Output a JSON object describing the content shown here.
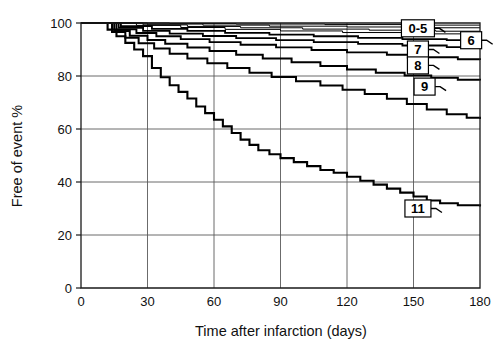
{
  "chart_data": {
    "type": "line",
    "subtype": "kaplan-meier-step",
    "title": "",
    "xlabel": "Time after infarction (days)",
    "ylabel": "Free of event %",
    "xlim": [
      0,
      180
    ],
    "ylim": [
      0,
      100
    ],
    "xticks": [
      0,
      30,
      60,
      90,
      120,
      150,
      180
    ],
    "yticks": [
      0,
      20,
      40,
      60,
      80,
      100
    ],
    "xtick_labels": [
      "0",
      "30",
      "60",
      "90",
      "120",
      "150",
      "180"
    ],
    "ytick_labels": [
      "0",
      "20",
      "40",
      "60",
      "80",
      "100"
    ],
    "grid": "both",
    "legend_position": "inline-callouts",
    "series": [
      {
        "name": "0-5",
        "label": "0-5",
        "stroke_width": 1.0,
        "final_value": 99.2,
        "points": [
          [
            0,
            100
          ],
          [
            8,
            100
          ],
          [
            40,
            99.8
          ],
          [
            70,
            99.6
          ],
          [
            110,
            99.4
          ],
          [
            150,
            99.2
          ],
          [
            180,
            99.2
          ]
        ]
      },
      {
        "name": "0-5b",
        "label": "",
        "stroke_width": 1.0,
        "final_value": 98.2,
        "points": [
          [
            0,
            100
          ],
          [
            8,
            100
          ],
          [
            30,
            99.6
          ],
          [
            55,
            99.2
          ],
          [
            85,
            98.8
          ],
          [
            120,
            98.5
          ],
          [
            155,
            98.2
          ],
          [
            180,
            98.2
          ]
        ]
      },
      {
        "name": "0-5c",
        "label": "",
        "stroke_width": 1.0,
        "final_value": 96.9,
        "points": [
          [
            0,
            100
          ],
          [
            8,
            100
          ],
          [
            28,
            99.3
          ],
          [
            48,
            98.7
          ],
          [
            72,
            98.2
          ],
          [
            100,
            97.7
          ],
          [
            130,
            97.3
          ],
          [
            160,
            96.9
          ],
          [
            180,
            96.9
          ]
        ]
      },
      {
        "name": "0-5d",
        "label": "",
        "stroke_width": 1.0,
        "final_value": 95.6,
        "points": [
          [
            0,
            100
          ],
          [
            8,
            100
          ],
          [
            25,
            99.1
          ],
          [
            45,
            98.3
          ],
          [
            65,
            97.6
          ],
          [
            90,
            97.0
          ],
          [
            118,
            96.4
          ],
          [
            148,
            95.9
          ],
          [
            175,
            95.6
          ],
          [
            180,
            95.6
          ]
        ]
      },
      {
        "name": "6",
        "label": "6",
        "stroke_width": 1.8,
        "final_value": 93.4,
        "points": [
          [
            0,
            100
          ],
          [
            8,
            100
          ],
          [
            18,
            98.8
          ],
          [
            32,
            97.8
          ],
          [
            48,
            97.0
          ],
          [
            65,
            96.3
          ],
          [
            85,
            95.6
          ],
          [
            105,
            95.0
          ],
          [
            125,
            94.4
          ],
          [
            145,
            93.9
          ],
          [
            165,
            93.5
          ],
          [
            180,
            93.4
          ]
        ]
      },
      {
        "name": "7",
        "label": "7",
        "stroke_width": 1.8,
        "final_value": 90.6,
        "points": [
          [
            0,
            100
          ],
          [
            8,
            100
          ],
          [
            17,
            98.2
          ],
          [
            28,
            97.0
          ],
          [
            40,
            96.0
          ],
          [
            55,
            95.1
          ],
          [
            70,
            94.3
          ],
          [
            88,
            93.5
          ],
          [
            105,
            92.8
          ],
          [
            125,
            92.1
          ],
          [
            145,
            91.5
          ],
          [
            165,
            90.9
          ],
          [
            180,
            90.6
          ]
        ]
      },
      {
        "name": "8",
        "label": "8",
        "stroke_width": 1.9,
        "final_value": 86.0,
        "points": [
          [
            0,
            100
          ],
          [
            8,
            100
          ],
          [
            16,
            97.6
          ],
          [
            25,
            96.2
          ],
          [
            34,
            95.0
          ],
          [
            45,
            93.9
          ],
          [
            58,
            92.8
          ],
          [
            72,
            91.8
          ],
          [
            88,
            90.8
          ],
          [
            104,
            89.8
          ],
          [
            120,
            88.9
          ],
          [
            138,
            88.0
          ],
          [
            155,
            87.1
          ],
          [
            170,
            86.3
          ],
          [
            180,
            86.0
          ]
        ]
      },
      {
        "name": "9",
        "label": "9",
        "stroke_width": 2.0,
        "final_value": 78.3,
        "points": [
          [
            0,
            100
          ],
          [
            8,
            100
          ],
          [
            15,
            97.0
          ],
          [
            22,
            95.2
          ],
          [
            30,
            93.6
          ],
          [
            38,
            92.2
          ],
          [
            48,
            90.8
          ],
          [
            58,
            89.4
          ],
          [
            70,
            88.0
          ],
          [
            82,
            86.6
          ],
          [
            95,
            85.2
          ],
          [
            108,
            83.8
          ],
          [
            120,
            82.5
          ],
          [
            133,
            81.2
          ],
          [
            146,
            80.2
          ],
          [
            158,
            79.3
          ],
          [
            170,
            78.6
          ],
          [
            180,
            78.3
          ]
        ]
      },
      {
        "name": "10",
        "label": "",
        "stroke_width": 2.0,
        "final_value": 63.8,
        "points": [
          [
            0,
            100
          ],
          [
            8,
            100
          ],
          [
            14,
            96.6
          ],
          [
            20,
            94.4
          ],
          [
            26,
            92.4
          ],
          [
            33,
            90.4
          ],
          [
            40,
            88.4
          ],
          [
            48,
            86.6
          ],
          [
            57,
            84.8
          ],
          [
            66,
            83.0
          ],
          [
            76,
            81.2
          ],
          [
            86,
            79.6
          ],
          [
            97,
            78.0
          ],
          [
            108,
            76.4
          ],
          [
            118,
            74.8
          ],
          [
            128,
            73.2
          ],
          [
            138,
            71.4
          ],
          [
            147,
            69.4
          ],
          [
            156,
            67.4
          ],
          [
            165,
            65.6
          ],
          [
            174,
            64.2
          ],
          [
            180,
            63.8
          ]
        ]
      },
      {
        "name": "11",
        "label": "11",
        "stroke_width": 2.1,
        "final_value": 30.8,
        "points": [
          [
            0,
            100
          ],
          [
            8,
            100
          ],
          [
            12,
            97.5
          ],
          [
            16,
            95.0
          ],
          [
            20,
            92.5
          ],
          [
            24,
            90.0
          ],
          [
            28,
            87.5
          ],
          [
            32,
            83.0
          ],
          [
            36,
            79.5
          ],
          [
            40,
            76.5
          ],
          [
            44,
            74.0
          ],
          [
            48,
            71.5
          ],
          [
            52,
            68.5
          ],
          [
            56,
            66.0
          ],
          [
            60,
            63.5
          ],
          [
            64,
            61.0
          ],
          [
            68,
            58.5
          ],
          [
            72,
            56.0
          ],
          [
            76,
            54.0
          ],
          [
            80,
            52.0
          ],
          [
            85,
            50.5
          ],
          [
            90,
            49.0
          ],
          [
            96,
            47.5
          ],
          [
            102,
            46.0
          ],
          [
            108,
            44.5
          ],
          [
            114,
            43.5
          ],
          [
            120,
            42.0
          ],
          [
            126,
            40.5
          ],
          [
            132,
            39.0
          ],
          [
            138,
            37.5
          ],
          [
            144,
            36.0
          ],
          [
            150,
            34.5
          ],
          [
            156,
            33.0
          ],
          [
            162,
            32.0
          ],
          [
            170,
            31.2
          ],
          [
            180,
            30.8
          ]
        ]
      }
    ],
    "callouts": [
      {
        "label": "0-5",
        "x_day": 152,
        "y_pct": 98.0,
        "box_w": 33,
        "box_h": 17
      },
      {
        "label": "6",
        "x_day": 176,
        "y_pct": 93.5,
        "box_w": 21,
        "box_h": 17
      },
      {
        "label": "7",
        "x_day": 152,
        "y_pct": 90.0,
        "box_w": 21,
        "box_h": 17
      },
      {
        "label": "8",
        "x_day": 152,
        "y_pct": 84.0,
        "box_w": 21,
        "box_h": 17
      },
      {
        "label": "9",
        "x_day": 155,
        "y_pct": 76.0,
        "box_w": 21,
        "box_h": 17
      },
      {
        "label": "11",
        "x_day": 152,
        "y_pct": 30.0,
        "box_w": 26,
        "box_h": 17
      }
    ]
  },
  "caption": ""
}
